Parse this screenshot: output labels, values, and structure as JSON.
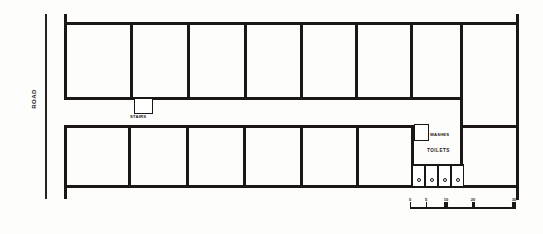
{
  "drawing": {
    "type": "architectural-floor-plan",
    "title": "",
    "ink_color": "#1a1714",
    "paper_color": "#fdfdfc"
  },
  "road": {
    "label": "ROAD",
    "orientation": "vertical",
    "line_x": 45
  },
  "blocks": {
    "top_row": {
      "name": "upper-room-block",
      "x": 64,
      "y": 22,
      "width": 396,
      "height": 78,
      "room_count": 7,
      "partition_x": [
        130,
        187,
        244,
        300,
        355,
        410
      ]
    },
    "bottom_row": {
      "name": "lower-room-block",
      "x": 64,
      "y": 125,
      "width": 348,
      "height": 63,
      "room_count": 6,
      "partition_x": [
        128,
        186,
        243,
        300,
        356
      ]
    },
    "right_wing": {
      "name": "right-end-room",
      "x": 460,
      "y": 22,
      "width": 58,
      "height": 166,
      "divider_y": 125
    }
  },
  "annexes": [
    {
      "name": "upper-annexe",
      "label": "STAIRS",
      "x": 134,
      "y": 98,
      "width": 17,
      "height": 14,
      "label_x": 130,
      "label_y": 114
    },
    {
      "name": "lower-annexe",
      "label": "WASHES",
      "x": 414,
      "y": 124,
      "width": 13,
      "height": 15,
      "label_x": 430,
      "label_y": 132
    }
  ],
  "toilets": {
    "label": "TOILETS",
    "label_x": 427,
    "label_y": 148,
    "block_x": 412,
    "block_y": 165,
    "block_width": 52,
    "block_height": 23,
    "stall_count": 4,
    "stall_labels": [
      "wc-1",
      "wc-2",
      "wc-3",
      "wc-4"
    ]
  },
  "scale": {
    "name": "scale-bar",
    "x": 410,
    "y": 200,
    "width": 106,
    "ticks": [
      {
        "label": "0",
        "pos": 0
      },
      {
        "label": "5",
        "pos": 16
      },
      {
        "label": "10",
        "pos": 34
      },
      {
        "label": "20",
        "pos": 62
      },
      {
        "label": "30",
        "pos": 104
      }
    ]
  }
}
